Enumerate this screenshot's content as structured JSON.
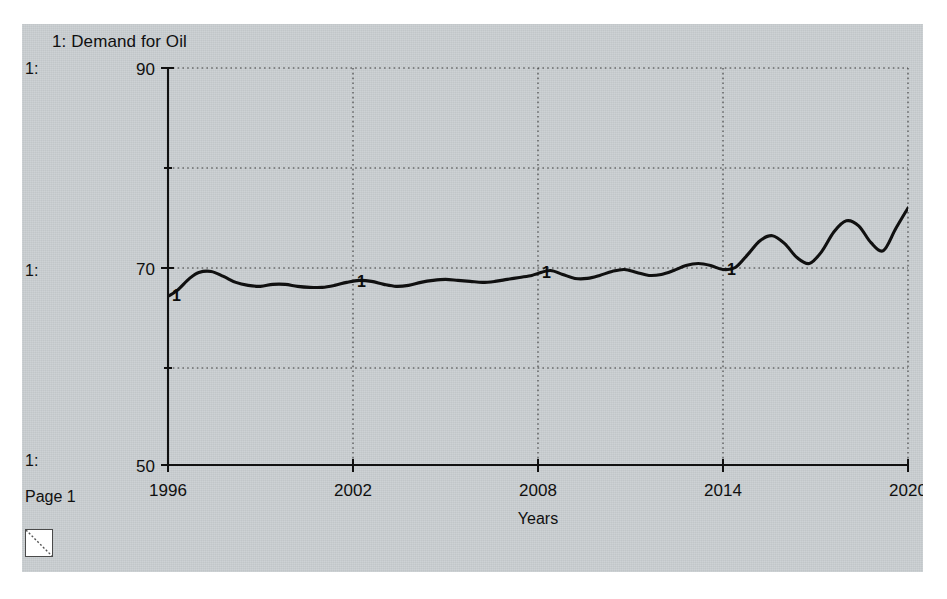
{
  "window": {
    "page_label": "Page 1",
    "resize_grip_icon": "resize-grip-icon",
    "background_color": "#c9ced1"
  },
  "legend": {
    "title": "1: Demand for Oil",
    "series_tags": [
      "1:",
      "1:",
      "1:"
    ],
    "marker_label": "1"
  },
  "chart_data": {
    "type": "line",
    "title": "1: Demand for Oil",
    "xlabel": "Years",
    "ylabel": "",
    "xlim": [
      1996,
      2020
    ],
    "ylim": [
      50,
      90
    ],
    "xticks": [
      1996,
      2002,
      2008,
      2014,
      2020
    ],
    "xtick_labels": [
      "1996",
      "2002",
      "2008",
      "2014",
      "2020"
    ],
    "yticks": [
      50,
      60,
      70,
      80,
      90
    ],
    "ytick_labels": [
      "50",
      "",
      "70",
      "",
      "90"
    ],
    "grid": true,
    "grid_style": "dotted",
    "legend": "1: Demand for Oil",
    "legend_position": "top-left",
    "line_color": "#101010",
    "line_width": 3,
    "series": [
      {
        "name": "Demand for Oil",
        "marker_label": "1",
        "marker_years": [
          1996,
          2002,
          2008,
          2014
        ],
        "x": [
          1996.0,
          1996.3,
          1996.7,
          1997.0,
          1997.4,
          1997.8,
          1998.2,
          1998.6,
          1999.0,
          1999.4,
          1999.8,
          2000.2,
          2000.6,
          2001.0,
          2001.4,
          2001.8,
          2002.2,
          2002.6,
          2003.0,
          2003.4,
          2003.8,
          2004.2,
          2004.6,
          2005.0,
          2005.4,
          2005.8,
          2006.2,
          2006.6,
          2007.0,
          2007.4,
          2007.8,
          2008.0,
          2008.4,
          2008.8,
          2009.2,
          2009.6,
          2010.0,
          2010.4,
          2010.8,
          2011.2,
          2011.6,
          2012.0,
          2012.4,
          2012.8,
          2013.2,
          2013.6,
          2014.0,
          2014.4,
          2014.8,
          2015.2,
          2015.6,
          2016.0,
          2016.4,
          2016.8,
          2017.2,
          2017.6,
          2018.0,
          2018.4,
          2018.8,
          2019.2,
          2019.6,
          2020.0
        ],
        "y": [
          67.0,
          67.6,
          68.8,
          69.4,
          69.5,
          69.0,
          68.4,
          68.1,
          68.0,
          68.2,
          68.2,
          68.0,
          67.9,
          67.9,
          68.1,
          68.4,
          68.6,
          68.5,
          68.2,
          68.0,
          68.1,
          68.4,
          68.6,
          68.7,
          68.6,
          68.5,
          68.4,
          68.5,
          68.7,
          68.9,
          69.1,
          69.3,
          69.6,
          69.2,
          68.8,
          68.8,
          69.1,
          69.5,
          69.7,
          69.4,
          69.1,
          69.2,
          69.6,
          70.1,
          70.3,
          70.1,
          69.7,
          69.9,
          71.2,
          72.6,
          73.1,
          72.3,
          70.9,
          70.3,
          71.5,
          73.5,
          74.6,
          74.1,
          72.4,
          71.6,
          73.8,
          75.9
        ]
      }
    ]
  }
}
